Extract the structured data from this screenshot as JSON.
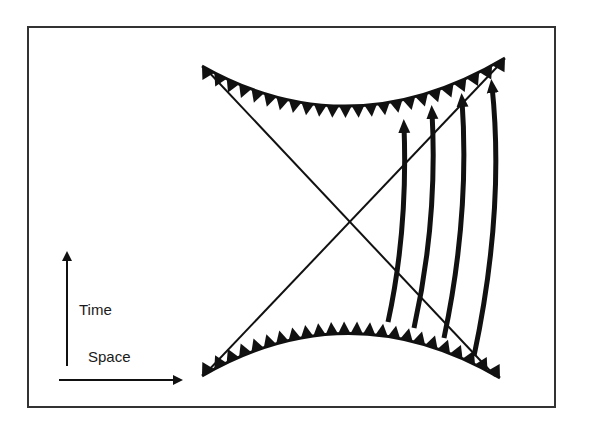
{
  "figure": {
    "type": "spacetime-diagram",
    "colors": {
      "ink": "#111111",
      "background": "#ffffff",
      "frame": "#333333"
    }
  },
  "axes": {
    "time_label": "Time",
    "space_label": "Space"
  },
  "elements": {
    "future_singularity": "jagged curve at top",
    "past_singularity": "jagged curve at bottom",
    "horizon_lines": 2,
    "worldlines": 4
  }
}
